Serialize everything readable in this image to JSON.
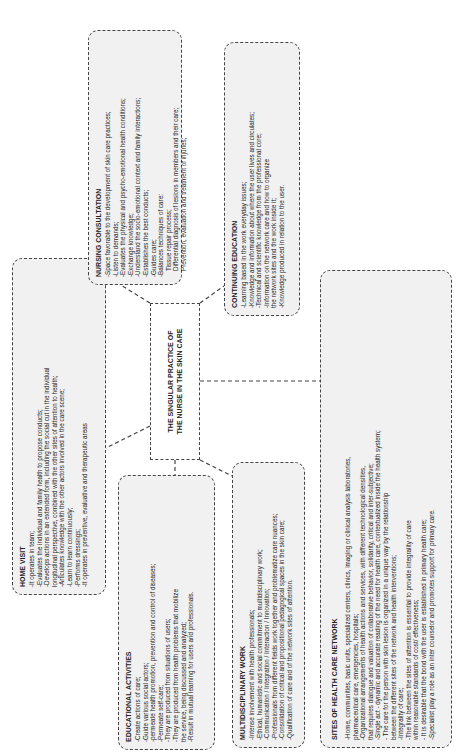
{
  "diagram": {
    "center": {
      "line1": "THE SINGULAR PRACTICE OF",
      "line2": "THE NURSE IN THE SKIN CARE"
    },
    "home_visit": {
      "title": "HOME VISIT",
      "lines": [
        "-It operates in team;",
        "-Evaluates the individual and family health to propose conducts;",
        "-Develops actions in an extended form, including the social cut in the individual",
        "longitudinal perspective, combined with the other sites of attention to health;",
        "-Articulates knowledge with the other actors involved in the care scene;",
        "-Learn to learn continuously;",
        "-Performs dressings;",
        "-It operates in preventive, evaluative and therapeutic areas"
      ]
    },
    "nursing_consultation": {
      "title": "NURSING CONSULTATION",
      "lines": [
        "-Space favorable to the development of skin care practices;",
        "-Listen to demands;",
        "-Evaluates the physical and psycho-emotional health conditions;",
        "-Exchange knowledge;",
        "-Understand the socio-emotional context and family interactions;",
        "-Establishes the best conducts;",
        "-Guides care;",
        "-Balances techniques of care:",
        "Tissue repair process;",
        "Differential diagnosis of lesions in members and their care;",
        "Prevention, evaluation and treatment of injuries;"
      ]
    },
    "continuing_education": {
      "title": "CONTINUING EDUCATION",
      "lines": [
        "-Learning based in the work everyday issues;",
        "-Knowledge and information about where the user lives and circulates;",
        "-Technical and scientific knowledge from the professional core;",
        "-Information on the network care and how to organize",
        "the network sites and the work inside it;",
        "-Knowledge produced in relation to the user."
      ]
    },
    "educational_activities": {
      "title": "EDUCATIONAL ACTIVITIES",
      "lines": [
        "-Create actions of care;",
        "-Guide various social actors;",
        "-permeate health promotion, prevention and control of diseases;",
        "-Permeate self-care;",
        "-They are produced from situations of users;",
        "-They are produced from health problems that mobilize",
        "the service, being discussed and analyzed;",
        "-Result in mutual learning for users and professionals."
      ]
    },
    "multidisciplinary_work": {
      "title": "MULTIDISCIPLINARY WORK",
      "lines": [
        "-Intense involvement with health professionals;",
        "-Ethical, humanistic and social commitment to multidisciplinary work;",
        "-Communication / Integration / Interaction / Innovation;",
        "-Professionals from different fields work together and problematize care nuances;",
        "-Consolidation of critical and propositional pedagogical spaces in the skin care;",
        "-Qualification of care and of the network sites of attention."
      ]
    },
    "sites_network": {
      "title": "SITES OF HEALTH CARE NETWORK",
      "lines": [
        "-Home, communities, basic units, specialized centers, clinics, imaging or clinical analysis laboratories,",
        "pharmaceutical care, emergencies, hospitals;",
        "-Organizational arrangements of health actions and services, with different technological densities,",
        "that requires dialogue and valuation of collaborative behavior, solidarity, critical and inter-subjective;",
        "-Single act - dynamic and accurate reading of the need for health care, contextualized inside the health system;",
        "- The care for the person with skin lesion is organized in a unique way by the relationship",
        "between the different sites of the network and health interventions;",
        "-Integrality of care;",
        "-The link between the sites of attention is essential to provide integrality of care",
        "within reasonable standards of cost/ effectiveness;",
        "- It is desirable that the bond with the user is established in primary health care;",
        "-Specialist play a role as an inter counselor and promotes support for primary care."
      ]
    }
  }
}
